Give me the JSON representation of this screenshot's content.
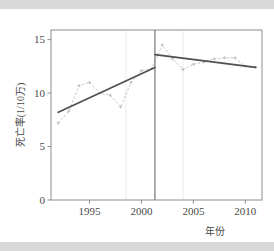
{
  "chart_data": {
    "type": "line",
    "title": "",
    "xlabel": "年份",
    "ylabel": "死亡率(1/10万)",
    "xlim": [
      1991.3,
      2011.6
    ],
    "ylim": [
      0,
      15.9
    ],
    "xticks": [
      1995,
      2000,
      2005,
      2010
    ],
    "xtick_labels": [
      "1995",
      "2000",
      "2005",
      "2010"
    ],
    "yticks": [
      0,
      5,
      10,
      15
    ],
    "ytick_labels": [
      "0",
      "5",
      "10",
      "15"
    ],
    "grid": false,
    "legend": "none",
    "joinpoint_year": 2001.3,
    "series": [
      {
        "name": "观察值",
        "style": "dashed-with-markers",
        "color": "#b0b0b0",
        "x": [
          1992,
          1993,
          1994,
          1995,
          1996,
          1997,
          1998,
          1999,
          2000,
          2001,
          2002,
          2003,
          2004,
          2005,
          2006,
          2007,
          2008,
          2009,
          2010,
          2011
        ],
        "values": [
          7.2,
          8.3,
          10.7,
          11.0,
          10.0,
          9.8,
          8.7,
          11.0,
          12.1,
          12.3,
          14.5,
          13.2,
          12.2,
          12.7,
          12.9,
          13.2,
          13.3,
          13.3,
          12.5,
          12.4
        ]
      },
      {
        "name": "趋势段1",
        "style": "solid",
        "color": "#4f4f4f",
        "x": [
          1992,
          2001.3
        ],
        "values": [
          8.2,
          12.4
        ]
      },
      {
        "name": "趋势段2",
        "style": "solid",
        "color": "#4f4f4f",
        "x": [
          2001.3,
          2011
        ],
        "values": [
          13.6,
          12.4
        ]
      }
    ]
  }
}
